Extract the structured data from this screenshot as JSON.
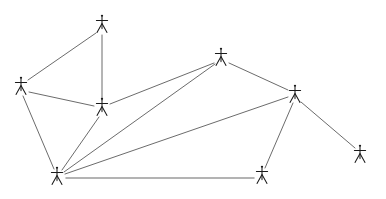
{
  "figure": {
    "title": "",
    "background_color": "#ffffff",
    "width": 386,
    "height": 199,
    "node_icon": "person-stick-figure-icon",
    "node_color": "#1a1a1a",
    "edge_color": "#5a5a5a",
    "edge_color_light": "#9a9a9a"
  },
  "chart_data": {
    "type": "diagram",
    "subtype": "node-link-graph",
    "title": "",
    "xlabel": "",
    "ylabel": "",
    "grid": false,
    "legend": "none",
    "directed": false,
    "node_count": 8,
    "edge_count": 12,
    "nodes": [
      {
        "id": "n1",
        "label": "",
        "x": 102,
        "y": 25,
        "icon": "person-icon"
      },
      {
        "id": "n2",
        "label": "",
        "x": 21,
        "y": 87,
        "icon": "person-icon"
      },
      {
        "id": "n3",
        "label": "",
        "x": 102,
        "y": 108,
        "icon": "person-icon"
      },
      {
        "id": "n4",
        "label": "",
        "x": 221,
        "y": 58,
        "icon": "person-icon"
      },
      {
        "id": "n5",
        "label": "",
        "x": 295,
        "y": 95,
        "icon": "person-icon"
      },
      {
        "id": "n6",
        "label": "",
        "x": 360,
        "y": 155,
        "icon": "person-icon"
      },
      {
        "id": "n7",
        "label": "",
        "x": 262,
        "y": 176,
        "icon": "person-icon"
      },
      {
        "id": "n8",
        "label": "",
        "x": 57,
        "y": 177,
        "icon": "person-icon"
      }
    ],
    "edges": [
      {
        "source": "n1",
        "target": "n2",
        "x1": 96,
        "y1": 33,
        "x2": 28,
        "y2": 80,
        "style": "normal"
      },
      {
        "source": "n1",
        "target": "n3",
        "x1": 102,
        "y1": 35,
        "x2": 102,
        "y2": 100,
        "style": "normal"
      },
      {
        "source": "n2",
        "target": "n3",
        "x1": 29,
        "y1": 92,
        "x2": 94,
        "y2": 106,
        "style": "normal"
      },
      {
        "source": "n2",
        "target": "n8",
        "x1": 23,
        "y1": 96,
        "x2": 54,
        "y2": 169,
        "style": "normal"
      },
      {
        "source": "n3",
        "target": "n4",
        "x1": 110,
        "y1": 104,
        "x2": 214,
        "y2": 63,
        "style": "normal"
      },
      {
        "source": "n3",
        "target": "n8",
        "x1": 99,
        "y1": 117,
        "x2": 62,
        "y2": 170,
        "style": "normal"
      },
      {
        "source": "n4",
        "target": "n5",
        "x1": 229,
        "y1": 63,
        "x2": 288,
        "y2": 90,
        "style": "normal"
      },
      {
        "source": "n4",
        "target": "n8",
        "x1": 215,
        "y1": 64,
        "x2": 64,
        "y2": 172,
        "style": "normal"
      },
      {
        "source": "n5",
        "target": "n6",
        "x1": 301,
        "y1": 102,
        "x2": 355,
        "y2": 148,
        "style": "normal"
      },
      {
        "source": "n5",
        "target": "n7",
        "x1": 293,
        "y1": 103,
        "x2": 265,
        "y2": 168,
        "style": "normal"
      },
      {
        "source": "n5",
        "target": "n8",
        "x1": 288,
        "y1": 97,
        "x2": 65,
        "y2": 174,
        "style": "normal"
      },
      {
        "source": "n7",
        "target": "n8",
        "x1": 254,
        "y1": 178,
        "x2": 66,
        "y2": 178,
        "style": "light"
      }
    ]
  }
}
